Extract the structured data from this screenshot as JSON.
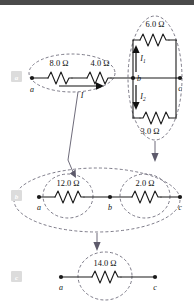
{
  "figure": {
    "background_color": "#ffffff",
    "header_bar_color": "#4a4a4a",
    "wire_color": "#1a1a1a",
    "annotation_color": "#5d5a6b",
    "badge_color": "#dcdcdc"
  },
  "panels": [
    {
      "badge": "a",
      "description": "original circuit",
      "nodes": [
        {
          "label": "a"
        },
        {
          "label": "b"
        },
        {
          "label": "c"
        }
      ],
      "resistors": [
        {
          "value": "8.0",
          "unit": "Ω",
          "label": "8.0 Ω"
        },
        {
          "value": "4.0",
          "unit": "Ω",
          "label": "4.0 Ω"
        },
        {
          "value": "6.0",
          "unit": "Ω",
          "label": "6.0 Ω"
        },
        {
          "value": "3.0",
          "unit": "Ω",
          "label": "3.0 Ω"
        }
      ],
      "currents": [
        {
          "symbol": "I",
          "subscript": "",
          "direction": "right"
        },
        {
          "symbol": "I",
          "subscript": "1",
          "direction": "up"
        },
        {
          "symbol": "I",
          "subscript": "2",
          "direction": "down"
        }
      ]
    },
    {
      "badge": "b",
      "description": "first reduction",
      "nodes": [
        {
          "label": "a"
        },
        {
          "label": "b"
        },
        {
          "label": "c"
        }
      ],
      "resistors": [
        {
          "value": "12.0",
          "unit": "Ω",
          "label": "12.0 Ω"
        },
        {
          "value": "2.0",
          "unit": "Ω",
          "label": "2.0 Ω"
        }
      ],
      "currents": []
    },
    {
      "badge": "c",
      "description": "final equivalent resistance",
      "nodes": [
        {
          "label": "a"
        },
        {
          "label": "c"
        }
      ],
      "resistors": [
        {
          "value": "14.0",
          "unit": "Ω",
          "label": "14.0 Ω"
        }
      ],
      "currents": []
    }
  ],
  "labels": {
    "r_8": "8.0 Ω",
    "r_4": "4.0 Ω",
    "r_6": "6.0 Ω",
    "r_3": "3.0 Ω",
    "r_12": "12.0 Ω",
    "r_2": "2.0 Ω",
    "r_14": "14.0 Ω",
    "node_a1": "a",
    "node_b1": "b",
    "node_c1": "c",
    "node_a2": "a",
    "node_b2": "b",
    "node_c2": "c",
    "node_a3": "a",
    "node_c3": "c",
    "current_I": "I",
    "current_I1": "I",
    "current_I1_sub": "1",
    "current_I2": "I",
    "current_I2_sub": "2",
    "badge_a": "a",
    "badge_b": "b",
    "badge_c": "c"
  }
}
